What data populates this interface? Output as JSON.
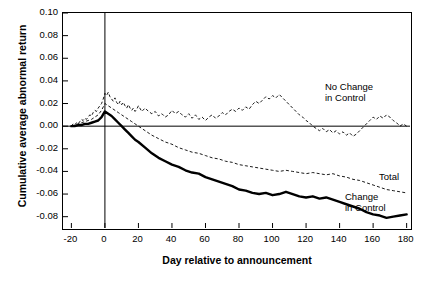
{
  "chart_data": {
    "type": "line",
    "title": "",
    "xlabel": "Day relative to announcement",
    "ylabel": "Cumulative average abnormal return",
    "xlim": [
      -25,
      182
    ],
    "ylim": [
      -0.09,
      0.1
    ],
    "grid": false,
    "legend_position": "inline-annotations",
    "xticks": [
      -20,
      0,
      20,
      40,
      60,
      80,
      100,
      120,
      140,
      160,
      180
    ],
    "xtick_labels": [
      "-20",
      "0",
      "20",
      "40",
      "60",
      "80",
      "100",
      "120",
      "140",
      "160",
      "180"
    ],
    "yticks": [
      0.1,
      0.08,
      0.06,
      0.04,
      0.02,
      0.0,
      -0.02,
      -0.04,
      -0.06,
      -0.08
    ],
    "ytick_labels": [
      "0.10",
      "0.08",
      "0.06",
      "0.04",
      "0.02",
      "0.00",
      "-0.02",
      "-0.04",
      "-0.06",
      "-0.08"
    ],
    "reference_lines": [
      {
        "name": "event-day-line",
        "axis": "x",
        "value": 0
      },
      {
        "name": "zero-return-line",
        "axis": "y",
        "value": 0.0
      }
    ],
    "annotations": [
      {
        "name": "no-change-in-control-label",
        "text": "No Change\nin Control",
        "x": 112,
        "y": 0.042
      },
      {
        "name": "total-label",
        "text": "Total",
        "x": 150,
        "y": -0.04
      },
      {
        "name": "change-in-control-label",
        "text": "Change\nin Control",
        "x": 122,
        "y": -0.056
      }
    ],
    "series": [
      {
        "name": "No Change in Control",
        "style": "thin-dashed",
        "x": [
          -20,
          -19,
          -18,
          -17,
          -16,
          -15,
          -14,
          -13,
          -12,
          -11,
          -10,
          -9,
          -8,
          -7,
          -6,
          -5,
          -4,
          -3,
          -2,
          -1,
          0,
          1,
          2,
          3,
          4,
          5,
          6,
          7,
          8,
          9,
          10,
          11,
          12,
          13,
          14,
          15,
          16,
          17,
          18,
          19,
          20,
          22,
          24,
          26,
          28,
          30,
          32,
          34,
          36,
          38,
          40,
          42,
          44,
          46,
          48,
          50,
          52,
          54,
          56,
          58,
          60,
          62,
          64,
          66,
          68,
          70,
          72,
          74,
          76,
          78,
          80,
          82,
          84,
          86,
          88,
          90,
          92,
          94,
          96,
          98,
          100,
          102,
          104,
          106,
          108,
          110,
          112,
          114,
          116,
          118,
          120,
          122,
          124,
          126,
          128,
          130,
          132,
          134,
          136,
          138,
          140,
          142,
          144,
          146,
          148,
          150,
          152,
          154,
          156,
          158,
          160,
          162,
          164,
          166,
          168,
          170,
          172,
          174,
          176,
          178,
          180
        ],
        "values": [
          0.0,
          0.002,
          0.001,
          0.003,
          0.002,
          0.004,
          0.006,
          0.005,
          0.007,
          0.006,
          0.008,
          0.01,
          0.009,
          0.012,
          0.014,
          0.013,
          0.016,
          0.018,
          0.02,
          0.024,
          0.029,
          0.027,
          0.03,
          0.026,
          0.024,
          0.022,
          0.025,
          0.021,
          0.019,
          0.022,
          0.019,
          0.021,
          0.018,
          0.016,
          0.019,
          0.016,
          0.014,
          0.016,
          0.013,
          0.015,
          0.018,
          0.013,
          0.016,
          0.013,
          0.011,
          0.013,
          0.009,
          0.011,
          0.008,
          0.01,
          0.014,
          0.011,
          0.013,
          0.01,
          0.008,
          0.011,
          0.007,
          0.01,
          0.006,
          0.008,
          0.005,
          0.008,
          0.01,
          0.007,
          0.009,
          0.012,
          0.01,
          0.013,
          0.015,
          0.013,
          0.016,
          0.014,
          0.017,
          0.015,
          0.019,
          0.022,
          0.02,
          0.023,
          0.026,
          0.024,
          0.027,
          0.025,
          0.028,
          0.025,
          0.022,
          0.019,
          0.016,
          0.013,
          0.01,
          0.008,
          0.005,
          0.003,
          0.0,
          -0.002,
          -0.004,
          -0.002,
          -0.005,
          -0.003,
          -0.006,
          -0.004,
          -0.007,
          -0.005,
          -0.008,
          -0.006,
          -0.009,
          -0.007,
          -0.004,
          -0.001,
          0.002,
          0.005,
          0.008,
          0.006,
          0.009,
          0.007,
          0.01,
          0.008,
          0.005,
          0.003,
          0.0,
          0.002,
          0.0
        ]
      },
      {
        "name": "Total",
        "style": "thin-dashed",
        "x": [
          -20,
          -18,
          -16,
          -14,
          -12,
          -10,
          -8,
          -6,
          -4,
          -2,
          0,
          2,
          4,
          6,
          8,
          10,
          12,
          14,
          16,
          18,
          20,
          24,
          28,
          32,
          36,
          40,
          44,
          48,
          52,
          56,
          60,
          64,
          68,
          72,
          76,
          80,
          84,
          88,
          92,
          96,
          100,
          104,
          108,
          112,
          116,
          120,
          124,
          128,
          132,
          136,
          140,
          144,
          148,
          152,
          156,
          160,
          164,
          168,
          172,
          176,
          180
        ],
        "values": [
          0.0,
          0.001,
          0.002,
          0.003,
          0.004,
          0.005,
          0.006,
          0.008,
          0.01,
          0.014,
          0.02,
          0.018,
          0.016,
          0.014,
          0.012,
          0.01,
          0.008,
          0.006,
          0.004,
          0.002,
          0.0,
          -0.004,
          -0.008,
          -0.011,
          -0.014,
          -0.016,
          -0.019,
          -0.021,
          -0.023,
          -0.024,
          -0.026,
          -0.028,
          -0.029,
          -0.031,
          -0.032,
          -0.034,
          -0.035,
          -0.036,
          -0.037,
          -0.038,
          -0.039,
          -0.04,
          -0.039,
          -0.04,
          -0.041,
          -0.042,
          -0.041,
          -0.042,
          -0.043,
          -0.042,
          -0.044,
          -0.045,
          -0.047,
          -0.048,
          -0.05,
          -0.052,
          -0.054,
          -0.056,
          -0.057,
          -0.058,
          -0.059
        ]
      },
      {
        "name": "Change in Control",
        "style": "thick-solid",
        "x": [
          -20,
          -18,
          -16,
          -14,
          -12,
          -10,
          -8,
          -6,
          -4,
          -2,
          0,
          2,
          4,
          6,
          8,
          10,
          12,
          14,
          16,
          18,
          20,
          24,
          28,
          32,
          36,
          40,
          44,
          48,
          52,
          56,
          60,
          64,
          68,
          72,
          76,
          80,
          84,
          88,
          92,
          96,
          100,
          104,
          108,
          112,
          116,
          120,
          124,
          128,
          132,
          136,
          140,
          144,
          148,
          152,
          156,
          160,
          164,
          168,
          172,
          176,
          180
        ],
        "values": [
          0.0,
          0.0,
          0.001,
          0.001,
          0.002,
          0.002,
          0.003,
          0.004,
          0.005,
          0.008,
          0.013,
          0.011,
          0.009,
          0.006,
          0.003,
          0.0,
          -0.003,
          -0.006,
          -0.009,
          -0.012,
          -0.014,
          -0.019,
          -0.024,
          -0.028,
          -0.031,
          -0.034,
          -0.036,
          -0.039,
          -0.041,
          -0.042,
          -0.045,
          -0.047,
          -0.049,
          -0.051,
          -0.053,
          -0.056,
          -0.057,
          -0.059,
          -0.06,
          -0.059,
          -0.061,
          -0.06,
          -0.058,
          -0.06,
          -0.062,
          -0.063,
          -0.062,
          -0.064,
          -0.063,
          -0.065,
          -0.067,
          -0.069,
          -0.071,
          -0.073,
          -0.076,
          -0.078,
          -0.079,
          -0.081,
          -0.08,
          -0.079,
          -0.078
        ]
      }
    ],
    "colors": {
      "axis": "#000000",
      "line": "#000000",
      "background": "#ffffff"
    }
  }
}
